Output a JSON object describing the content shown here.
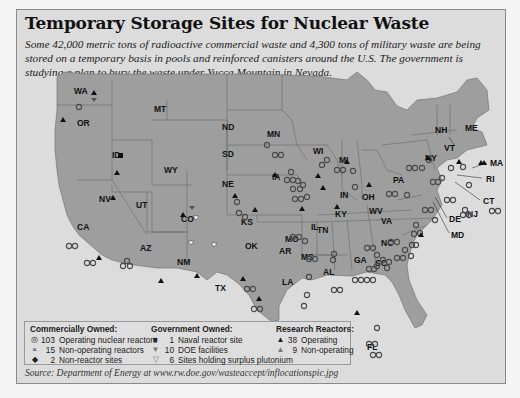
{
  "title": "Temporary Storage Sites for Nuclear Waste",
  "subtitle": "Some 42,000 metric tons of radioactive commercial waste and 4,300 tons of military waste are being stored on a temporary basis in pools and reinforced canisters around the U.S. The government is studying a plan to bury the waste under Yucca Mountain in Nevada.",
  "map": {
    "region": "Contiguous United States",
    "state_labels": [
      "WA",
      "OR",
      "CA",
      "NV",
      "ID",
      "MT",
      "WY",
      "UT",
      "AZ",
      "CO",
      "NM",
      "ND",
      "SD",
      "NE",
      "KS",
      "OK",
      "TX",
      "MN",
      "IA",
      "MO",
      "AR",
      "LA",
      "WI",
      "IL",
      "MI",
      "IN",
      "OH",
      "KY",
      "TN",
      "MS",
      "AL",
      "GA",
      "FL",
      "SC",
      "NC",
      "VA",
      "WV",
      "PA",
      "NY",
      "VT",
      "NH",
      "ME",
      "MA",
      "RI",
      "CT",
      "NJ",
      "DE",
      "MD"
    ],
    "colors": {
      "land": "#9e9e9e",
      "water": "#dcdcdc",
      "border": "#6a6a6a",
      "marker": "#111111"
    }
  },
  "legend": {
    "commercial": {
      "heading": "Commercially Owned:",
      "items": [
        {
          "icon": "ring-icon",
          "count": "103",
          "label": "Operating nuclear reactors"
        },
        {
          "icon": "x-icon",
          "count": "15",
          "label": "Non-operating reactors"
        },
        {
          "icon": "diamond-icon",
          "count": "2",
          "label": "Non-reactor sites"
        }
      ]
    },
    "government": {
      "heading": "Government Owned:",
      "items": [
        {
          "icon": "square-icon",
          "count": "1",
          "label": "Naval reactor site"
        },
        {
          "icon": "down-triangle-icon",
          "count": "10",
          "label": "DOE facilities"
        },
        {
          "icon": "open-down-triangle-icon",
          "count": "6",
          "label": "Sites holding surplus plutonium"
        }
      ]
    },
    "research": {
      "heading": "Research Reactors:",
      "items": [
        {
          "icon": "triangle-icon",
          "count": "38",
          "label": "Operating"
        },
        {
          "icon": "grey-triangle-icon",
          "count": "9",
          "label": "Non-operating"
        }
      ]
    }
  },
  "source": "Source: Department of Energy at www.rw.doe.gov/wasteaccept/inflocationspic.jpg"
}
